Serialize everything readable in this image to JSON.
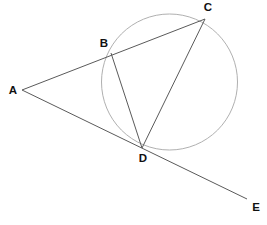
{
  "figure": {
    "background_color": "#ffffff",
    "width": 267,
    "height": 225
  },
  "style": {
    "line_color": "#5a5a5a",
    "line_width": 1,
    "circle_stroke_color": "#b0b0b0",
    "circle_stroke_width": 1,
    "circle_fill": "none",
    "label_color": "#111111",
    "label_font_size": 11.5
  },
  "circle": {
    "name": "circle",
    "cx": 169.5,
    "cy": 82,
    "r": 68
  },
  "points": [
    {
      "id": "A",
      "label": "A",
      "x": 22,
      "y": 90,
      "label_x": 13,
      "label_y": 91,
      "on_circle": false
    },
    {
      "id": "B",
      "label": "B",
      "x": 111,
      "y": 53,
      "label_x": 104,
      "label_y": 44,
      "on_circle": true
    },
    {
      "id": "C",
      "label": "C",
      "x": 205,
      "y": 19,
      "label_x": 208,
      "label_y": 8,
      "on_circle": true
    },
    {
      "id": "D",
      "label": "D",
      "x": 142,
      "y": 148,
      "label_x": 143,
      "label_y": 159,
      "on_circle": true
    },
    {
      "id": "E",
      "label": "E",
      "x": 247,
      "y": 199,
      "label_x": 256,
      "label_y": 208,
      "on_circle": false
    }
  ],
  "segments": [
    {
      "id": "AC",
      "name": "secant-a-to-c",
      "from": "A",
      "to": "C",
      "x1": 22,
      "y1": 90,
      "x2": 205,
      "y2": 19
    },
    {
      "id": "AE",
      "name": "secant-a-to-e",
      "from": "A",
      "to": "E",
      "x1": 22,
      "y1": 90,
      "x2": 247,
      "y2": 199
    },
    {
      "id": "BD",
      "name": "chord-b-to-d",
      "from": "B",
      "to": "D",
      "x1": 111,
      "y1": 53,
      "x2": 142,
      "y2": 148
    },
    {
      "id": "CD",
      "name": "chord-c-to-d",
      "from": "C",
      "to": "D",
      "x1": 205,
      "y1": 19,
      "x2": 142,
      "y2": 148
    }
  ]
}
